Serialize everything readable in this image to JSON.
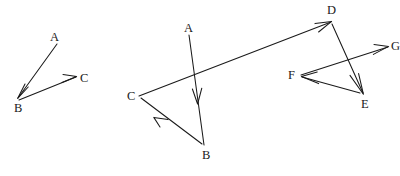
{
  "image": {
    "width": 400,
    "height": 176,
    "background_color": "#ffffff",
    "ink_color": "#1a1a1a",
    "description": "Three hand-drawn style vector diagrams showing chains of directed arrows between labelled points"
  },
  "figures": [
    {
      "id": "figure-left",
      "name": "left-vector-diagram",
      "labels": [
        {
          "id": "left-A",
          "text": "A",
          "x": 50,
          "y": 31
        },
        {
          "id": "left-B",
          "text": "B",
          "x": 14,
          "y": 102
        },
        {
          "id": "left-C",
          "text": "C",
          "x": 80,
          "y": 72
        }
      ],
      "vectors": [
        {
          "id": "left-AB",
          "from": "A",
          "to": "B",
          "x1": 57,
          "y1": 44,
          "x2": 18,
          "y2": 98
        },
        {
          "id": "left-BC",
          "from": "B",
          "to": "C",
          "x1": 19,
          "y1": 100,
          "x2": 76,
          "y2": 77
        }
      ]
    },
    {
      "id": "figure-middle",
      "name": "middle-vector-diagram",
      "labels": [
        {
          "id": "mid-A",
          "text": "A",
          "x": 184,
          "y": 22
        },
        {
          "id": "mid-B",
          "text": "B",
          "x": 202,
          "y": 149
        },
        {
          "id": "mid-C",
          "text": "C",
          "x": 127,
          "y": 90
        }
      ],
      "vectors": [
        {
          "id": "mid-AB",
          "from": "A",
          "to": "B",
          "x1": 189,
          "y1": 35,
          "x2": 204,
          "y2": 145
        },
        {
          "id": "mid-BC",
          "from": "B",
          "to": "C",
          "x1": 202,
          "y1": 144,
          "x2": 141,
          "y2": 98
        },
        {
          "id": "mid-CD",
          "from": "C",
          "to": "D",
          "x1": 139,
          "y1": 96,
          "x2": 331,
          "y2": 22
        }
      ]
    },
    {
      "id": "figure-right",
      "name": "right-vector-diagram",
      "labels": [
        {
          "id": "right-D",
          "text": "D",
          "x": 327,
          "y": 4
        },
        {
          "id": "right-E",
          "text": "E",
          "x": 361,
          "y": 98
        },
        {
          "id": "right-F",
          "text": "F",
          "x": 288,
          "y": 69
        },
        {
          "id": "right-G",
          "text": "G",
          "x": 391,
          "y": 40
        }
      ],
      "vectors": [
        {
          "id": "right-DE",
          "from": "D",
          "to": "E",
          "x1": 332,
          "y1": 24,
          "x2": 363,
          "y2": 93
        },
        {
          "id": "right-EF",
          "from": "E",
          "to": "F",
          "x1": 360,
          "y1": 93,
          "x2": 302,
          "y2": 77
        },
        {
          "id": "right-FG",
          "from": "F",
          "to": "G",
          "x1": 301,
          "y1": 75,
          "x2": 388,
          "y2": 47
        }
      ]
    }
  ]
}
